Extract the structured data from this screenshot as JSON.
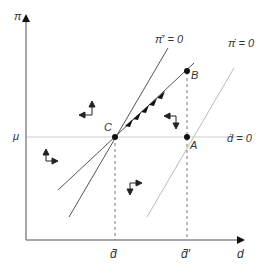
{
  "diagram": {
    "type": "phase-diagram",
    "axes": {
      "y_label": "π",
      "x_label": "d",
      "y_tick_label": "μ",
      "x_tick_labels": [
        "d̄",
        "d̄′"
      ]
    },
    "curves": {
      "pi_dot_prime_label": "π̇′ = 0",
      "pi_dot_label": "π̇ = 0",
      "d_dot_label": "ḋ = 0"
    },
    "points": {
      "A": "A",
      "B": "B",
      "C": "C"
    },
    "colors": {
      "axis": "#888888",
      "curve_dark": "#555555",
      "curve_light": "#bbbbbb",
      "guide": "#cccccc",
      "point": "#111111",
      "arrow": "#222222"
    }
  }
}
